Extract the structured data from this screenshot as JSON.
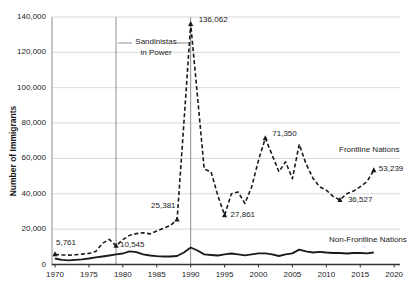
{
  "chart_data": {
    "type": "line",
    "title": "",
    "xlabel": "",
    "ylabel": "Number of Immigrants",
    "xlim": [
      1970,
      2020
    ],
    "ylim": [
      0,
      140000
    ],
    "grid": "horizontal",
    "legend_position": "inline-labels",
    "x_ticks": [
      "1970",
      "1975",
      "1980",
      "1985",
      "1990",
      "1995",
      "2000",
      "2005",
      "2010",
      "2015",
      "2020"
    ],
    "y_ticks": [
      "0",
      "20,000",
      "40,000",
      "60,000",
      "80,000",
      "100,000",
      "120,000",
      "140,000"
    ],
    "y_tick_values": [
      0,
      20000,
      40000,
      60000,
      80000,
      100000,
      120000,
      140000
    ],
    "years": [
      1970,
      1971,
      1972,
      1973,
      1974,
      1975,
      1976,
      1977,
      1978,
      1979,
      1980,
      1981,
      1982,
      1983,
      1984,
      1985,
      1986,
      1987,
      1988,
      1989,
      1990,
      1991,
      1992,
      1993,
      1994,
      1995,
      1996,
      1997,
      1998,
      1999,
      2000,
      2001,
      2002,
      2003,
      2004,
      2005,
      2006,
      2007,
      2008,
      2009,
      2010,
      2011,
      2012,
      2013,
      2014,
      2015,
      2016,
      2017
    ],
    "series": [
      {
        "name": "Frontline Nations",
        "style": "dashed",
        "values": [
          5761,
          5400,
          5300,
          5500,
          5900,
          6300,
          7400,
          12000,
          14200,
          10545,
          14000,
          16500,
          17500,
          18000,
          17300,
          19000,
          20500,
          22000,
          25381,
          80000,
          136062,
          95000,
          54000,
          52500,
          39000,
          27861,
          40000,
          41000,
          34500,
          44000,
          59000,
          71350,
          62000,
          52500,
          58000,
          48500,
          68000,
          57000,
          49000,
          44000,
          42000,
          38500,
          36527,
          40000,
          41500,
          44000,
          47000,
          53239
        ]
      },
      {
        "name": "Non-Frontline Nations",
        "style": "solid",
        "values": [
          3400,
          2600,
          2400,
          2600,
          2900,
          3400,
          4000,
          4500,
          5100,
          5700,
          6200,
          7400,
          7000,
          5700,
          5100,
          4700,
          4500,
          4500,
          4800,
          6800,
          9600,
          7900,
          5700,
          5400,
          5100,
          5700,
          6200,
          5700,
          5200,
          5700,
          6300,
          6300,
          5700,
          4800,
          5700,
          6300,
          8400,
          7400,
          6800,
          7200,
          6800,
          6500,
          6500,
          6200,
          6500,
          6500,
          6300,
          6800
        ]
      }
    ],
    "event_lines": {
      "years": [
        1979,
        1990
      ],
      "label_line1": "Sandinistas",
      "label_line2": "in Power"
    },
    "point_labels": [
      {
        "text": "5,761",
        "year": 1970,
        "value": 5761,
        "dx": 1,
        "dy": -16
      },
      {
        "text": "10,545",
        "year": 1979,
        "value": 10545,
        "dx": 4,
        "dy": -6
      },
      {
        "text": "25,381",
        "year": 1988,
        "value": 25381,
        "dx": -26,
        "dy": -19
      },
      {
        "text": "136,062",
        "year": 1990,
        "value": 136062,
        "dx": 8,
        "dy": -9
      },
      {
        "text": "27,861",
        "year": 1995,
        "value": 27861,
        "dx": 6,
        "dy": -5
      },
      {
        "text": "71,350",
        "year": 2001,
        "value": 71350,
        "dx": 7,
        "dy": -9
      },
      {
        "text": "36,527",
        "year": 2012,
        "value": 36527,
        "dx": 8,
        "dy": -5
      },
      {
        "text": "53,239",
        "year": 2017,
        "value": 53239,
        "dx": 5,
        "dy": -6
      }
    ],
    "colors": {
      "line": "#1a1a1a",
      "grid": "#d9d9d9",
      "x_axis": "#333333",
      "y_axis": "#8c8c8c",
      "event_line": "#8f8f8f",
      "text": "#1a1a1a",
      "background": "#ffffff"
    }
  }
}
